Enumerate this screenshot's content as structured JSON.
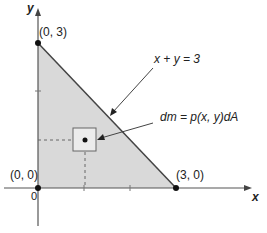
{
  "diagram": {
    "axes": {
      "x_label": "x",
      "y_label": "y",
      "origin_tick": "0"
    },
    "points": [
      {
        "label": "(0, 3)",
        "x": 0,
        "y": 3
      },
      {
        "label": "(0, 0)",
        "x": 0,
        "y": 0
      },
      {
        "label": "(3, 0)",
        "x": 3,
        "y": 0
      }
    ],
    "annotations": {
      "line_label": "x + y = 3",
      "element_label": "dm = p(x, y)dA"
    },
    "colors": {
      "region_fill": "#d9d9d9",
      "line": "#444444",
      "axis": "#555555"
    }
  }
}
